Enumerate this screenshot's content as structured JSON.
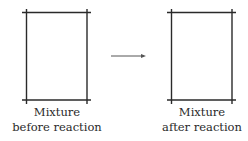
{
  "figure": {
    "left_container": {
      "label_line1": "Mixture",
      "label_line2": "before reaction"
    },
    "arrow": {
      "direction": "right"
    },
    "right_container": {
      "label_line1": "Mixture",
      "label_line2": "after reaction"
    },
    "colors": {
      "line": "#2a2a2a",
      "background": "#ffffff"
    }
  }
}
